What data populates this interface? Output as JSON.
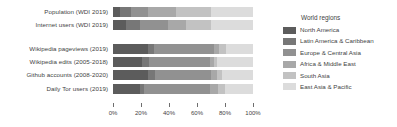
{
  "chart_data": {
    "type": "bar",
    "orientation": "horizontal",
    "stacked": true,
    "normalized": true,
    "title": "",
    "xlabel": "",
    "ylabel": "",
    "xlim": [
      0,
      100
    ],
    "grid": false,
    "legend_position": "right",
    "legend_title": "World regions",
    "categories": [
      "Population (WDI 2019)",
      "Internet users (WDI 2019)",
      "Wikipedia pageviews (2019)",
      "Wikipedia edits (2005-2018)",
      "Github accounts (2008-2020)",
      "Daily Tor users (2019)"
    ],
    "group_breaks": [
      2
    ],
    "series": [
      {
        "name": "North America",
        "color": "#5c5c5c",
        "values": [
          5,
          9,
          25,
          21,
          25,
          19
        ]
      },
      {
        "name": "Latin America & Caribbean",
        "color": "#777777",
        "values": [
          8,
          10,
          4,
          5,
          5,
          3
        ]
      },
      {
        "name": "Europe & Central Asia",
        "color": "#919191",
        "values": [
          12,
          20,
          43,
          43,
          40,
          47
        ]
      },
      {
        "name": "Africa & Middle East",
        "color": "#a8a8a8",
        "values": [
          20,
          13,
          4,
          3,
          4,
          6
        ]
      },
      {
        "name": "South Asia",
        "color": "#c2c2c2",
        "values": [
          25,
          18,
          5,
          2,
          4,
          5
        ]
      },
      {
        "name": "East Asia & Pacific",
        "color": "#dcdcdc",
        "values": [
          30,
          30,
          19,
          26,
          22,
          20
        ]
      }
    ],
    "xticks": [
      0,
      20,
      40,
      60,
      80,
      100
    ],
    "xtick_labels": [
      "0%",
      "20%",
      "40%",
      "60%",
      "80%",
      "100%"
    ]
  },
  "legend": {
    "title": "World regions",
    "entries": [
      {
        "label": "North America",
        "color": "#5c5c5c"
      },
      {
        "label": "Latin America & Caribbean",
        "color": "#777777"
      },
      {
        "label": "Europe & Central Asia",
        "color": "#919191"
      },
      {
        "label": "Africa & Middle East",
        "color": "#a8a8a8"
      },
      {
        "label": "South Asia",
        "color": "#c2c2c2"
      },
      {
        "label": "East Asia & Pacific",
        "color": "#dcdcdc"
      }
    ]
  }
}
